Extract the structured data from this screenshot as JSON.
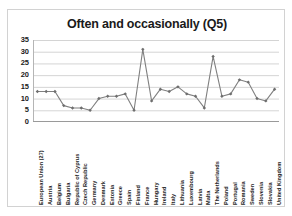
{
  "page": {
    "clipped_header_text": "• • • • • • • • • • • • • • • • • • • • • • • •"
  },
  "chart_data": {
    "type": "line",
    "title": "Often and occasionally (Q5)",
    "xlabel": "",
    "ylabel": "",
    "ylim": [
      0,
      35
    ],
    "ytick_step": 5,
    "yticks": [
      "0",
      "5",
      "10",
      "15",
      "20",
      "25",
      "30",
      "35"
    ],
    "grid": true,
    "legend": false,
    "marker": "diamond",
    "line_color": "#808080",
    "marker_color": "#6e6e6e",
    "grid_color": "#c9c9c9",
    "categories": [
      "European Union (27)",
      "Austria",
      "Belgium",
      "Bulgaria",
      "Republic of Cyprus",
      "Czech Republic",
      "Germany",
      "Denmark",
      "Estonia",
      "Greece",
      "Spain",
      "Finland",
      "France",
      "Hungary",
      "Ireland",
      "Italy",
      "Lithuania",
      "Luxembourg",
      "Latvia",
      "Malta",
      "The Netherlands",
      "Poland",
      "Portugal",
      "Romania",
      "Sweden",
      "Slovenia",
      "Slovakia",
      "United Kingdom"
    ],
    "values": [
      13,
      13,
      13,
      7,
      6,
      6,
      5,
      10,
      11,
      11,
      12,
      5,
      31,
      9,
      14,
      13,
      15,
      12,
      11,
      6,
      28,
      11,
      12,
      18,
      17,
      10,
      9,
      14
    ]
  }
}
